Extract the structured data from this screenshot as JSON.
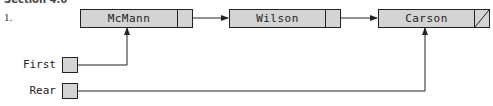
{
  "header": {
    "section_heading_partial": "Section 4.6",
    "item_number": "1."
  },
  "diagram": {
    "type": "linked-list-queue",
    "nodes": [
      {
        "id": "n1",
        "value": "McMann",
        "next": "n2"
      },
      {
        "id": "n2",
        "value": "Wilson",
        "next": "n3"
      },
      {
        "id": "n3",
        "value": "Carson",
        "next": null
      }
    ],
    "pointers": [
      {
        "label": "First",
        "target": "n1"
      },
      {
        "label": "Rear",
        "target": "n3"
      }
    ],
    "colors": {
      "node_fill": "#d4d4d4",
      "stroke": "#222222"
    }
  }
}
